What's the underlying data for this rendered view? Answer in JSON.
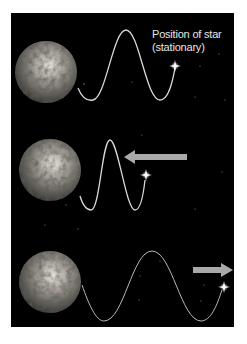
{
  "diagram": {
    "label_star": {
      "line1": "Position of star",
      "line2": "(stationary)"
    },
    "panels": [
      {
        "id": "stationary",
        "star_motion": "stationary",
        "arrow": "none",
        "wave": "normal wavelength"
      },
      {
        "id": "approaching",
        "star_motion": "toward Earth",
        "arrow": "left",
        "wave": "compressed (shorter wavelength)"
      },
      {
        "id": "receding",
        "star_motion": "away from Earth",
        "arrow": "right",
        "wave": "stretched (longer wavelength)"
      }
    ],
    "colors": {
      "background": "#000000",
      "page": "#ffffff",
      "wave": "#d8d8d8",
      "arrow": "#a9a9a9",
      "star": "#ffffff",
      "text": "#e6e6e6"
    },
    "icons": [
      "earth-globe",
      "star-sparkle",
      "arrow-left",
      "arrow-right"
    ]
  }
}
